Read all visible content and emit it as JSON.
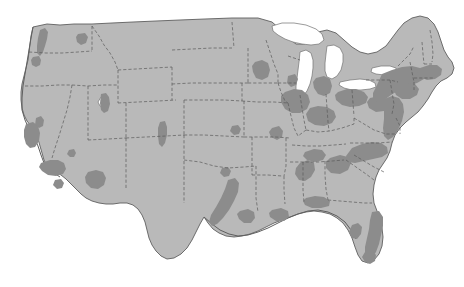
{
  "figure": {
    "kind": "thematic-map",
    "region": "Contiguous United States",
    "projection_style": "albers-like",
    "background_color": "#ffffff",
    "title": "",
    "caption": "",
    "legend_visible": false,
    "labels_visible": false,
    "border_visible": false
  },
  "map": {
    "base_land_color": "#b9b9b9",
    "highlight_color": "#8c8c8c",
    "water_color": "#ffffff",
    "coast_outline_color": "#5f5f5f",
    "state_border_color": "#5a5a5a",
    "state_border_style": "dashed",
    "width": 464,
    "height": 287
  },
  "water_bodies": [
    {
      "name": "lake-superior"
    },
    {
      "name": "lake-michigan"
    },
    {
      "name": "lake-huron"
    },
    {
      "name": "lake-erie"
    },
    {
      "name": "lake-ontario"
    },
    {
      "name": "great-salt-lake"
    }
  ],
  "highlighted_regions": [
    {
      "name": "puget-sound-seattle",
      "region": "Pacific Northwest"
    },
    {
      "name": "portland-willamette",
      "region": "Pacific Northwest"
    },
    {
      "name": "spokane",
      "region": "Pacific Northwest"
    },
    {
      "name": "san-francisco-bay-area",
      "region": "California"
    },
    {
      "name": "sacramento-valley",
      "region": "California"
    },
    {
      "name": "los-angeles-basin",
      "region": "California"
    },
    {
      "name": "san-diego",
      "region": "California"
    },
    {
      "name": "las-vegas",
      "region": "Southwest"
    },
    {
      "name": "phoenix-metro",
      "region": "Southwest"
    },
    {
      "name": "salt-lake-city-wasatch",
      "region": "Mountain West"
    },
    {
      "name": "denver-front-range",
      "region": "Mountain West"
    },
    {
      "name": "texas-triangle-corridor",
      "region": "Texas"
    },
    {
      "name": "houston",
      "region": "Texas"
    },
    {
      "name": "minneapolis-st-paul",
      "region": "Upper Midwest"
    },
    {
      "name": "chicago-metro",
      "region": "Great Lakes"
    },
    {
      "name": "milwaukee",
      "region": "Great Lakes"
    },
    {
      "name": "detroit-metro",
      "region": "Great Lakes"
    },
    {
      "name": "cleveland-ohio-valley",
      "region": "Great Lakes"
    },
    {
      "name": "indianapolis-cincinnati",
      "region": "Midwest"
    },
    {
      "name": "pittsburgh",
      "region": "Appalachia"
    },
    {
      "name": "northeast-megalopolis-corridor",
      "region": "Northeast"
    },
    {
      "name": "boston-metro",
      "region": "New England"
    },
    {
      "name": "new-york-metro",
      "region": "Northeast"
    },
    {
      "name": "philadelphia-baltimore-washington",
      "region": "Mid-Atlantic"
    },
    {
      "name": "piedmont-carolinas-corridor",
      "region": "Southeast"
    },
    {
      "name": "atlanta-metro",
      "region": "Southeast"
    },
    {
      "name": "birmingham-alabama",
      "region": "Southeast"
    },
    {
      "name": "nashville",
      "region": "Southeast"
    },
    {
      "name": "gulf-coast-mobile-pensacola",
      "region": "Gulf Coast"
    },
    {
      "name": "new-orleans",
      "region": "Gulf Coast"
    },
    {
      "name": "tampa-bay",
      "region": "Florida"
    },
    {
      "name": "florida-east-coast-corridor",
      "region": "Florida"
    },
    {
      "name": "south-florida-miami",
      "region": "Florida"
    },
    {
      "name": "st-louis",
      "region": "Midwest"
    },
    {
      "name": "kansas-city",
      "region": "Plains"
    },
    {
      "name": "oklahoma-city",
      "region": "Plains"
    }
  ]
}
